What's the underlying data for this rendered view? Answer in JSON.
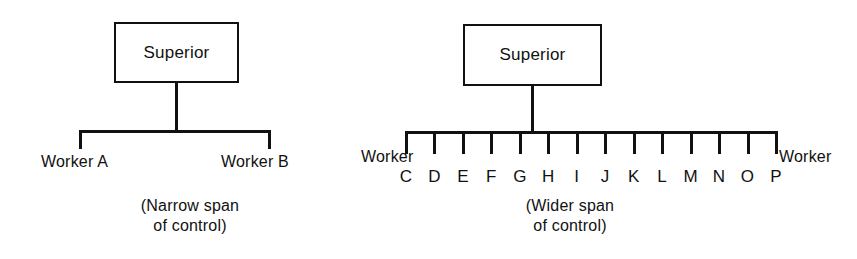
{
  "figure": {
    "type": "organizational-chart",
    "background_color": "#ffffff",
    "line_color": "#111111",
    "text_color": "#111111"
  },
  "diagrams": [
    {
      "id": "narrow-span",
      "superior": {
        "label": "Superior"
      },
      "subordinates": [
        {
          "label": "Worker A"
        },
        {
          "label": "Worker B"
        }
      ],
      "subordinate_count": 2,
      "caption": {
        "line1": "(Narrow span",
        "line2": "of control)"
      }
    },
    {
      "id": "wider-span",
      "superior": {
        "label": "Superior"
      },
      "edge_labels": {
        "left": "Worker",
        "right": "Worker"
      },
      "subordinates": [
        {
          "letter": "C"
        },
        {
          "letter": "D"
        },
        {
          "letter": "E"
        },
        {
          "letter": "F"
        },
        {
          "letter": "G"
        },
        {
          "letter": "H"
        },
        {
          "letter": "I"
        },
        {
          "letter": "J"
        },
        {
          "letter": "K"
        },
        {
          "letter": "L"
        },
        {
          "letter": "M"
        },
        {
          "letter": "N"
        },
        {
          "letter": "O"
        },
        {
          "letter": "P"
        }
      ],
      "subordinate_count": 14,
      "caption": {
        "line1": "(Wider span",
        "line2": "of control)"
      }
    }
  ]
}
